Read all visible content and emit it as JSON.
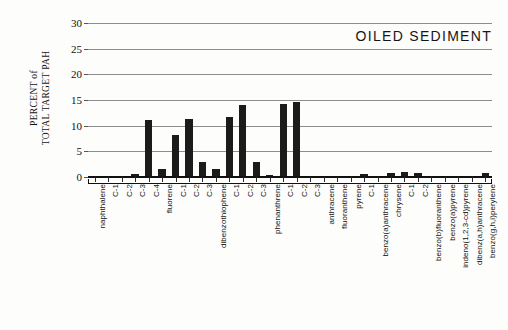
{
  "chart": {
    "title": "OILED SEDIMENT",
    "ylabel_line1": "PERCENT of",
    "ylabel_line2": "TOTAL TARGET PAH"
  },
  "chart_data": {
    "type": "bar",
    "title": "OILED SEDIMENT",
    "xlabel": "",
    "ylabel": "PERCENT of TOTAL TARGET PAH",
    "ylim": [
      0,
      30
    ],
    "yticks": [
      0,
      5,
      10,
      15,
      20,
      25,
      30
    ],
    "grid": true,
    "legend": "none",
    "bar_color": "#1b1b1b",
    "categories": [
      "naphthalene",
      "C-1",
      "C-2",
      "C-3",
      "C-4",
      "fluorene",
      "C-1",
      "C-2",
      "C-3",
      "dibenzothiophene",
      "C-1",
      "C-2",
      "C-3",
      "phenanthrene",
      "C-1",
      "C-2",
      "C-3",
      "anthracene",
      "fluoranthene",
      "pyrene",
      "C-1",
      "benzo(a)anthracene",
      "chrysene",
      "C-1",
      "C-2",
      "benzo(b)fluoranthene",
      "benzo(a)pyrene",
      "indeno(1,2,3-cd)pyrene",
      "dibenz(a,h)anthracene",
      "benzo(g,h,i)perylene"
    ],
    "values": [
      0.1,
      0.1,
      0.15,
      0.5,
      11.1,
      1.6,
      8.1,
      11.3,
      2.9,
      1.5,
      11.7,
      14.1,
      2.9,
      0.3,
      14.3,
      14.6,
      0.1,
      0.05,
      0.05,
      0.0,
      0.6,
      0.1,
      0.8,
      0.9,
      0.7,
      0.05,
      0.05,
      0.05,
      0.05,
      0.7
    ]
  }
}
